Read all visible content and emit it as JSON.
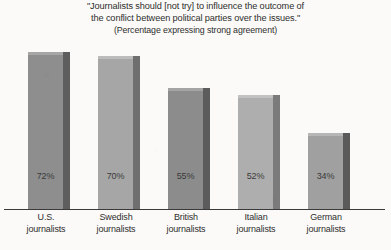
{
  "chart_data": {
    "type": "bar",
    "title_lines": [
      "\"Journalists should [not try] to influence the outcome of",
      "the conflict between political parties over the issues.\""
    ],
    "subtitle": "(Percentage expressing strong agreement)",
    "categories": [
      "U.S. journalists",
      "Swedish journalists",
      "British journalists",
      "Italian journalists",
      "German journalists"
    ],
    "category_lines": [
      {
        "line1": "U.S.",
        "line2": "journalists"
      },
      {
        "line1": "Swedish",
        "line2": "journalists"
      },
      {
        "line1": "British",
        "line2": "journalists"
      },
      {
        "line1": "Italian",
        "line2": "journalists"
      },
      {
        "line1": "German",
        "line2": "journalists"
      }
    ],
    "values": [
      72,
      70,
      55,
      52,
      34
    ],
    "value_labels": [
      "72%",
      "70%",
      "55%",
      "52%",
      "34%"
    ],
    "xlabel": "",
    "ylabel": "",
    "ylim": [
      0,
      80
    ],
    "grid": false,
    "legend": "none",
    "style": "3d-bars-grayscale",
    "colors": {
      "background": "#fbfaf8",
      "axis": "#3a3a3a",
      "text": "#2e2e2e",
      "bar_front_dark": "#8e8e8e",
      "bar_front_light": "#a8a8a8",
      "bar_side_dark": "#606060",
      "bar_side_light": "#777777"
    },
    "bar_faces": [
      {
        "front": "#8e8e8e",
        "side": "#5e5e5e",
        "top": "#a6a6a6"
      },
      {
        "front": "#a6a6a6",
        "side": "#6f6f6f",
        "top": "#bcbcbc"
      },
      {
        "front": "#8c8c8c",
        "side": "#5c5c5c",
        "top": "#a4a4a4"
      },
      {
        "front": "#aeaeae",
        "side": "#7b7b7b",
        "top": "#c2c2c2"
      },
      {
        "front": "#a0a0a0",
        "side": "#5a5a5a",
        "top": "#b6b6b6"
      }
    ]
  }
}
